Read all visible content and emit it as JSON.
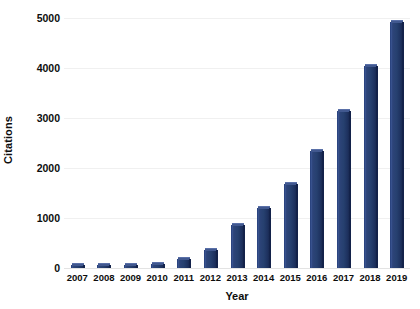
{
  "chart_data": {
    "type": "bar",
    "title": "",
    "xlabel": "Year",
    "ylabel": "Citations",
    "categories": [
      "2007",
      "2008",
      "2009",
      "2010",
      "2011",
      "2012",
      "2013",
      "2014",
      "2015",
      "2016",
      "2017",
      "2018",
      "2019"
    ],
    "values": [
      30,
      30,
      30,
      90,
      180,
      370,
      870,
      1210,
      1680,
      2350,
      3150,
      4050,
      4930
    ],
    "ylim": [
      0,
      5000
    ],
    "yticks": [
      0,
      1000,
      2000,
      3000,
      4000,
      5000
    ],
    "ytick_labels": [
      "0",
      "1000",
      "2000",
      "3000",
      "4000",
      "5000"
    ],
    "grid": true,
    "legend": false,
    "series": [
      {
        "name": "Citations",
        "values": [
          30,
          30,
          30,
          90,
          180,
          370,
          870,
          1210,
          1680,
          2350,
          3150,
          4050,
          4930
        ]
      }
    ],
    "colors": {
      "bar_face": "#26406f",
      "bar_highlight": "#3c5795",
      "bar_shadow": "#16264b",
      "bar_top": "#41588f",
      "gridline": "#f0f0f0",
      "background": "#ffffff",
      "text": "#0d0d0d"
    }
  }
}
